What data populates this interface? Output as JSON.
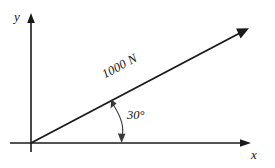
{
  "figure": {
    "background_color": "#ffffff",
    "line_color": "#1a1a1a",
    "arc_color": "#3a3a3a"
  },
  "axes": {
    "x_label": "x",
    "y_label": "y",
    "origin": {
      "x": 31,
      "y": 143
    },
    "x_axis": {
      "start_x": 10,
      "end_x": 250,
      "y": 143
    },
    "y_axis": {
      "x": 31,
      "start_y": 152,
      "end_y": 14
    }
  },
  "vector": {
    "magnitude_label": "1000 N",
    "angle_label": "30°",
    "angle_degrees": 30,
    "start": {
      "x": 31,
      "y": 143
    },
    "end": {
      "x": 248,
      "y": 28
    }
  },
  "arc": {
    "label": "30°",
    "from": {
      "x": 112,
      "y": 100
    },
    "to": {
      "x": 122,
      "y": 143
    }
  }
}
